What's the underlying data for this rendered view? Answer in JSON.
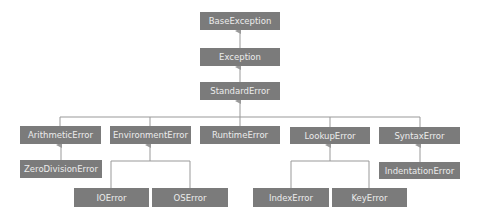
{
  "diagram": {
    "colors": {
      "node_fill": "#7b7b7b",
      "node_text": "#ececec",
      "edge": "#999999"
    },
    "nodes": {
      "base_exception": "BaseException",
      "exception": "Exception",
      "standard_error": "StandardError",
      "arithmetic_error": "ArithmeticError",
      "environment_error": "EnvironmentError",
      "runtime_error": "RuntimeError",
      "lookup_error": "LookupError",
      "syntax_error": "SyntaxError",
      "zero_division_error": "ZeroDivisionError",
      "io_error": "IOError",
      "os_error": "OSError",
      "index_error": "IndexError",
      "key_error": "KeyError",
      "indentation_error": "IndentationError"
    },
    "edges": [
      [
        "exception",
        "base_exception"
      ],
      [
        "standard_error",
        "exception"
      ],
      [
        "arithmetic_error",
        "standard_error"
      ],
      [
        "environment_error",
        "standard_error"
      ],
      [
        "runtime_error",
        "standard_error"
      ],
      [
        "lookup_error",
        "standard_error"
      ],
      [
        "syntax_error",
        "standard_error"
      ],
      [
        "zero_division_error",
        "arithmetic_error"
      ],
      [
        "io_error",
        "environment_error"
      ],
      [
        "os_error",
        "environment_error"
      ],
      [
        "index_error",
        "lookup_error"
      ],
      [
        "key_error",
        "lookup_error"
      ],
      [
        "indentation_error",
        "syntax_error"
      ]
    ]
  }
}
